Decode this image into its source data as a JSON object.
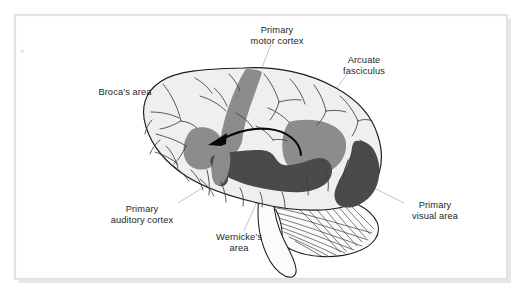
{
  "figure": {
    "background_color": "#ffffff",
    "frame_color": "#e2e2e2",
    "frame_shadow_color": "#e8e8e8"
  },
  "colors": {
    "brain_fill": "#efefef",
    "outline": "#1c1c1c",
    "region_medium_gray": "#8c8c8c",
    "region_dark_gray": "#4a4a4a",
    "arrow_black": "#090909",
    "leader_line": "#b4b4b4",
    "label_text": "#262626"
  },
  "labels": [
    {
      "id": "primary-motor-cortex",
      "lines": [
        "Primary",
        "motor cortex"
      ],
      "line1": "Primary",
      "line2": "motor cortex",
      "text_x": 277,
      "text_y": 33,
      "region_color": "#8c8c8c"
    },
    {
      "id": "arcuate-fasciculus",
      "lines": [
        "Arcuate",
        "fasciculus"
      ],
      "line1": "Arcuate",
      "line2": "fasciculus",
      "text_x": 364,
      "text_y": 63,
      "region_color": "#090909"
    },
    {
      "id": "brocas-area",
      "lines": [
        "Broca’s area"
      ],
      "line1": "Broca’s area",
      "line2": "",
      "text_x": 125,
      "text_y": 92,
      "region_color": "#8c8c8c"
    },
    {
      "id": "primary-auditory-cortex",
      "lines": [
        "Primary",
        "auditory cortex"
      ],
      "line1": "Primary",
      "line2": "auditory cortex",
      "text_x": 142,
      "text_y": 212,
      "region_color": "#4a4a4a"
    },
    {
      "id": "wernickes-area",
      "lines": [
        "Wernicke’s",
        "area"
      ],
      "line1": "Wernicke’s",
      "line2": "area",
      "text_x": 239,
      "text_y": 240,
      "region_color": "#4a4a4a"
    },
    {
      "id": "primary-visual-area",
      "lines": [
        "Primary",
        "visual area"
      ],
      "line1": "Primary",
      "line2": "visual area",
      "text_x": 435,
      "text_y": 208,
      "region_color": "#4a4a4a"
    }
  ],
  "structures": [
    {
      "id": "cerebrum",
      "name": "Cerebrum"
    },
    {
      "id": "cerebellum",
      "name": "Cerebellum"
    },
    {
      "id": "brainstem",
      "name": "Brainstem"
    }
  ]
}
